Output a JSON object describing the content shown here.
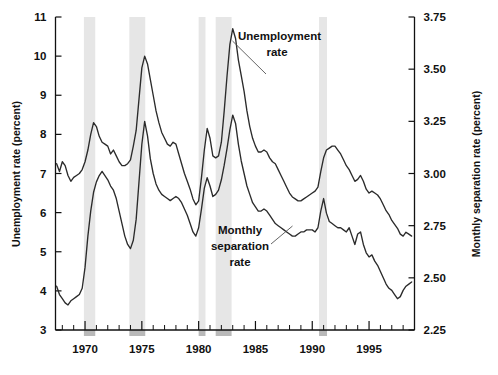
{
  "chart_data": {
    "type": "line",
    "title": "",
    "xlabel": "",
    "ylabel": "Unemployment rate (percent)",
    "y2label": "Monthly separation rate (percent)",
    "xlim": [
      1967.4,
      1999.0
    ],
    "ylim": [
      3,
      11
    ],
    "y2lim": [
      2.25,
      3.75
    ],
    "grid": false,
    "legend_position": "inline-annotations",
    "xticks": [
      1970,
      1975,
      1980,
      1985,
      1990,
      1995
    ],
    "xtick_labels": [
      "1970",
      "1975",
      "1980",
      "1985",
      "1990",
      "1995"
    ],
    "yticks": [
      3,
      4,
      5,
      6,
      7,
      8,
      9,
      10,
      11
    ],
    "ytick_labels": [
      "3",
      "4",
      "5",
      "6",
      "7",
      "8",
      "9",
      "10",
      "11"
    ],
    "y2ticks": [
      2.25,
      2.5,
      2.75,
      3.0,
      3.25,
      3.5,
      3.75
    ],
    "y2tick_labels": [
      "2.25",
      "2.50",
      "2.75",
      "3.00",
      "3.25",
      "3.50",
      "3.75"
    ],
    "minor_xtick_interval": 1,
    "annotations": [
      {
        "name": "unemployment-rate-label",
        "text": "Unemployment\nrate",
        "x": 1985.0,
        "y": 10.45
      },
      {
        "name": "monthly-separation-rate-label",
        "text": "Monthly\nseparation\nrate",
        "x": 1983.3,
        "y": 5.35
      }
    ],
    "shaded_bands": {
      "name": "recession-bands",
      "color": "#e6e6e6",
      "intervals": [
        [
          1969.9,
          1970.9
        ],
        [
          1973.9,
          1975.3
        ],
        [
          1980.0,
          1980.6
        ],
        [
          1981.5,
          1982.9
        ],
        [
          1990.6,
          1991.3
        ]
      ]
    },
    "series": [
      {
        "name": "Unemployment rate",
        "axis": "left",
        "units": "percent",
        "color": "#2b2b2b",
        "x": [
          1967.5,
          1967.75,
          1968.0,
          1968.25,
          1968.5,
          1968.75,
          1969.0,
          1969.25,
          1969.5,
          1969.75,
          1970.0,
          1970.25,
          1970.5,
          1970.75,
          1971.0,
          1971.25,
          1971.5,
          1971.75,
          1972.0,
          1972.25,
          1972.5,
          1972.75,
          1973.0,
          1973.25,
          1973.5,
          1973.75,
          1974.0,
          1974.25,
          1974.5,
          1974.75,
          1975.0,
          1975.25,
          1975.5,
          1975.75,
          1976.0,
          1976.25,
          1976.5,
          1976.75,
          1977.0,
          1977.25,
          1977.5,
          1977.75,
          1978.0,
          1978.25,
          1978.5,
          1978.75,
          1979.0,
          1979.25,
          1979.5,
          1979.75,
          1980.0,
          1980.25,
          1980.5,
          1980.75,
          1981.0,
          1981.25,
          1981.5,
          1981.75,
          1982.0,
          1982.25,
          1982.5,
          1982.75,
          1983.0,
          1983.25,
          1983.5,
          1983.75,
          1984.0,
          1984.25,
          1984.5,
          1984.75,
          1985.0,
          1985.25,
          1985.5,
          1985.75,
          1986.0,
          1986.25,
          1986.5,
          1986.75,
          1987.0,
          1987.25,
          1987.5,
          1987.75,
          1988.0,
          1988.25,
          1988.5,
          1988.75,
          1989.0,
          1989.25,
          1989.5,
          1989.75,
          1990.0,
          1990.25,
          1990.5,
          1990.75,
          1991.0,
          1991.25,
          1991.5,
          1991.75,
          1992.0,
          1992.25,
          1992.5,
          1992.75,
          1993.0,
          1993.25,
          1993.5,
          1993.75,
          1994.0,
          1994.25,
          1994.5,
          1994.75,
          1995.0,
          1995.25,
          1995.5,
          1995.75,
          1996.0,
          1996.25,
          1996.5,
          1996.75,
          1997.0,
          1997.25,
          1997.5,
          1997.75,
          1998.0,
          1998.25,
          1998.5,
          1998.75
        ],
        "y": [
          7.25,
          7.05,
          7.3,
          7.2,
          6.95,
          6.8,
          6.9,
          6.95,
          7.0,
          7.1,
          7.3,
          7.6,
          8.0,
          8.3,
          8.2,
          7.95,
          7.8,
          7.75,
          7.7,
          7.5,
          7.6,
          7.45,
          7.3,
          7.2,
          7.2,
          7.25,
          7.35,
          7.7,
          8.1,
          8.9,
          9.7,
          10.0,
          9.8,
          9.4,
          9.0,
          8.6,
          8.3,
          8.05,
          7.9,
          7.75,
          7.7,
          7.8,
          7.75,
          7.5,
          7.25,
          7.0,
          6.8,
          6.6,
          6.35,
          6.2,
          6.3,
          6.9,
          7.6,
          8.15,
          7.9,
          7.45,
          7.4,
          7.45,
          7.8,
          8.6,
          9.5,
          10.3,
          10.7,
          10.45,
          9.9,
          9.5,
          9.1,
          8.6,
          8.2,
          7.9,
          7.7,
          7.55,
          7.55,
          7.6,
          7.55,
          7.4,
          7.3,
          7.25,
          7.1,
          6.95,
          6.8,
          6.65,
          6.5,
          6.4,
          6.35,
          6.3,
          6.3,
          6.35,
          6.4,
          6.45,
          6.5,
          6.55,
          6.65,
          7.05,
          7.4,
          7.6,
          7.65,
          7.7,
          7.7,
          7.6,
          7.5,
          7.35,
          7.2,
          7.1,
          6.95,
          6.8,
          6.85,
          6.95,
          6.8,
          6.6,
          6.5,
          6.55,
          6.5,
          6.45,
          6.35,
          6.2,
          6.05,
          5.95,
          5.8,
          5.7,
          5.6,
          5.45,
          5.4,
          5.5,
          5.45,
          5.4
        ]
      },
      {
        "name": "Monthly separation rate",
        "axis": "right",
        "units": "percent",
        "color": "#2b2b2b",
        "x": [
          1967.5,
          1967.75,
          1968.0,
          1968.25,
          1968.5,
          1968.75,
          1969.0,
          1969.25,
          1969.5,
          1969.75,
          1970.0,
          1970.25,
          1970.5,
          1970.75,
          1971.0,
          1971.25,
          1971.5,
          1971.75,
          1972.0,
          1972.25,
          1972.5,
          1972.75,
          1973.0,
          1973.25,
          1973.5,
          1973.75,
          1974.0,
          1974.25,
          1974.5,
          1974.75,
          1975.0,
          1975.25,
          1975.5,
          1975.75,
          1976.0,
          1976.25,
          1976.5,
          1976.75,
          1977.0,
          1977.25,
          1977.5,
          1977.75,
          1978.0,
          1978.25,
          1978.5,
          1978.75,
          1979.0,
          1979.25,
          1979.5,
          1979.75,
          1980.0,
          1980.25,
          1980.5,
          1980.75,
          1981.0,
          1981.25,
          1981.5,
          1981.75,
          1982.0,
          1982.25,
          1982.5,
          1982.75,
          1983.0,
          1983.25,
          1983.5,
          1983.75,
          1984.0,
          1984.25,
          1984.5,
          1984.75,
          1985.0,
          1985.25,
          1985.5,
          1985.75,
          1986.0,
          1986.25,
          1986.5,
          1986.75,
          1987.0,
          1987.25,
          1987.5,
          1987.75,
          1988.0,
          1988.25,
          1988.5,
          1988.75,
          1989.0,
          1989.25,
          1989.5,
          1989.75,
          1990.0,
          1990.25,
          1990.5,
          1990.75,
          1991.0,
          1991.25,
          1991.5,
          1991.75,
          1992.0,
          1992.25,
          1992.5,
          1992.75,
          1993.0,
          1993.25,
          1993.5,
          1993.75,
          1994.0,
          1994.25,
          1994.5,
          1994.75,
          1995.0,
          1995.25,
          1995.5,
          1995.75,
          1996.0,
          1996.25,
          1996.5,
          1996.75,
          1997.0,
          1997.25,
          1997.5,
          1997.75,
          1998.0,
          1998.25,
          1998.5,
          1998.75
        ],
        "y": [
          2.46,
          2.42,
          2.4,
          2.38,
          2.37,
          2.39,
          2.4,
          2.41,
          2.42,
          2.45,
          2.55,
          2.7,
          2.82,
          2.91,
          2.96,
          2.99,
          3.01,
          2.99,
          2.97,
          2.94,
          2.92,
          2.88,
          2.82,
          2.76,
          2.7,
          2.66,
          2.64,
          2.68,
          2.78,
          2.96,
          3.14,
          3.25,
          3.18,
          3.07,
          3.0,
          2.95,
          2.92,
          2.9,
          2.89,
          2.88,
          2.87,
          2.88,
          2.89,
          2.88,
          2.86,
          2.83,
          2.8,
          2.76,
          2.72,
          2.7,
          2.74,
          2.83,
          2.93,
          2.98,
          2.94,
          2.89,
          2.9,
          2.92,
          2.97,
          3.04,
          3.12,
          3.21,
          3.28,
          3.24,
          3.14,
          3.06,
          3.0,
          2.94,
          2.9,
          2.86,
          2.84,
          2.82,
          2.82,
          2.83,
          2.82,
          2.8,
          2.78,
          2.76,
          2.75,
          2.74,
          2.73,
          2.72,
          2.71,
          2.7,
          2.7,
          2.71,
          2.72,
          2.72,
          2.73,
          2.73,
          2.73,
          2.72,
          2.74,
          2.82,
          2.88,
          2.81,
          2.77,
          2.76,
          2.75,
          2.74,
          2.74,
          2.73,
          2.72,
          2.74,
          2.7,
          2.66,
          2.71,
          2.72,
          2.66,
          2.62,
          2.6,
          2.61,
          2.58,
          2.56,
          2.53,
          2.5,
          2.47,
          2.45,
          2.44,
          2.42,
          2.4,
          2.41,
          2.44,
          2.46,
          2.47,
          2.48
        ]
      }
    ]
  },
  "axes": {
    "left_title": "Unemployment rate (percent)",
    "right_title": "Monthly separation rate (percent)"
  },
  "annotations": {
    "unemployment_line1": "Unemployment",
    "unemployment_line2": "rate",
    "separation_line1": "Monthly",
    "separation_line2": "separation",
    "separation_line3": "rate"
  }
}
